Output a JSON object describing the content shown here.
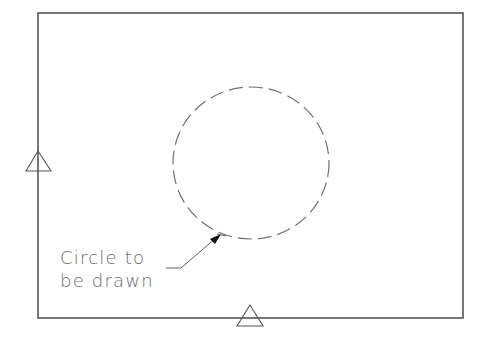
{
  "diagram": {
    "type": "technical-drawing",
    "colors": {
      "background": "#ffffff",
      "border": "#555555",
      "circle": "#707070",
      "triangle": "#555555",
      "text": "#6a6a6a",
      "leader": "#606060",
      "arrowhead": "#111111"
    },
    "frame": {
      "x": 38,
      "y": 13,
      "width": 425,
      "height": 305
    },
    "circle": {
      "cx": 251,
      "cy": 163,
      "r": 77,
      "style": "dashed"
    },
    "markers": [
      {
        "name": "left-datum-triangle",
        "apex": [
          38,
          151
        ],
        "base_y": 171,
        "base_x": [
          26,
          51
        ]
      },
      {
        "name": "bottom-datum-triangle",
        "apex": [
          250,
          305
        ],
        "base_y": 326,
        "base_x": [
          237,
          262
        ]
      }
    ],
    "callout": {
      "line1": "Circle to",
      "line2": "be drawn",
      "leader": {
        "start": [
          166,
          268
        ],
        "bend": [
          181,
          268
        ],
        "tip": [
          220,
          235
        ]
      }
    }
  }
}
